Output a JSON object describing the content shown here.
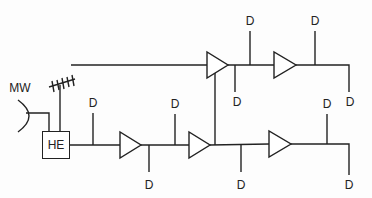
{
  "diagram": {
    "type": "cable distribution network",
    "headend": {
      "label": "HE"
    },
    "microwave": {
      "label": "MW"
    },
    "drop_label": "D",
    "drops": [
      {
        "id": "d1",
        "x": 93,
        "y": 103
      },
      {
        "id": "d2",
        "x": 175,
        "y": 104
      },
      {
        "id": "d3",
        "x": 149,
        "y": 185
      },
      {
        "id": "d4",
        "x": 241,
        "y": 185
      },
      {
        "id": "d5",
        "x": 250,
        "y": 20
      },
      {
        "id": "d6",
        "x": 237,
        "y": 102
      },
      {
        "id": "d7",
        "x": 315,
        "y": 20
      },
      {
        "id": "d8",
        "x": 349,
        "y": 102
      },
      {
        "id": "d9",
        "x": 327,
        "y": 104
      },
      {
        "id": "d10",
        "x": 349,
        "y": 185
      }
    ],
    "amplifiers": [
      {
        "id": "amp-trunk-1",
        "x": 120,
        "y": 145
      },
      {
        "id": "amp-trunk-2",
        "x": 189,
        "y": 145
      },
      {
        "id": "amp-trunk-3",
        "x": 269,
        "y": 144
      },
      {
        "id": "amp-branch-1",
        "x": 207,
        "y": 65
      },
      {
        "id": "amp-branch-2",
        "x": 274,
        "y": 65
      }
    ]
  }
}
